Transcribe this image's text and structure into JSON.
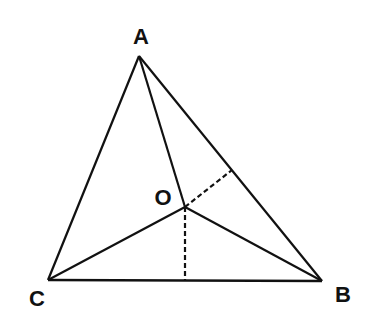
{
  "diagram": {
    "colors": {
      "stroke": "#111111",
      "background": "#ffffff"
    },
    "points": {
      "A": {
        "label": "A",
        "x": 139,
        "y": 56
      },
      "B": {
        "label": "B",
        "x": 322,
        "y": 281
      },
      "C": {
        "label": "C",
        "x": 48,
        "y": 280
      },
      "O": {
        "label": "O",
        "x": 185,
        "y": 207
      }
    },
    "segments": [
      {
        "from": "A",
        "to": "B",
        "style": "solid"
      },
      {
        "from": "B",
        "to": "C",
        "style": "solid"
      },
      {
        "from": "C",
        "to": "A",
        "style": "solid"
      },
      {
        "from": "A",
        "to": "O",
        "style": "solid"
      },
      {
        "from": "B",
        "to": "O",
        "style": "solid"
      },
      {
        "from": "C",
        "to": "O",
        "style": "solid"
      },
      {
        "from": "O",
        "to": "foot_BC",
        "style": "dashed"
      },
      {
        "from": "O",
        "to": "foot_AB",
        "style": "dashed"
      }
    ],
    "feet": {
      "foot_BC": {
        "x": 185,
        "y": 280
      },
      "foot_AB": {
        "x": 232,
        "y": 170
      }
    },
    "labels": {
      "A": "A",
      "B": "B",
      "C": "C",
      "O": "O"
    }
  }
}
